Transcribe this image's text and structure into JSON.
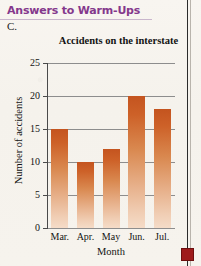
{
  "header": {
    "title": "Answers to Warm-Ups",
    "accent_color": "#84388c",
    "item_letter": "C."
  },
  "marker": {
    "name": "red-square-marker",
    "color": "#9e1b1b"
  },
  "chart_data": {
    "type": "bar",
    "title": "Accidents on the interstate",
    "xlabel": "Month",
    "ylabel": "Number of accidents",
    "categories": [
      "Mar.",
      "Apr.",
      "May",
      "Jun.",
      "Jul."
    ],
    "values": [
      15,
      10,
      12,
      20,
      18
    ],
    "ylim": [
      0,
      25
    ],
    "yticks": [
      0,
      5,
      10,
      15,
      20,
      25
    ],
    "ytick_labels": [
      "0",
      "5",
      "10",
      "15",
      "20",
      "25"
    ],
    "grid": true,
    "legend": false,
    "bar_color_top": "#c4541f",
    "bar_color_bottom": "#f5dcc8"
  }
}
